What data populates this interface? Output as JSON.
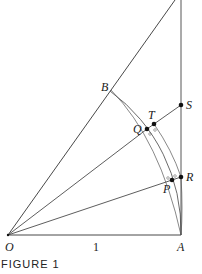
{
  "diagram": {
    "caption": "FIGURE 1",
    "unit_label": "1",
    "points": {
      "O": {
        "label": "O",
        "x": 8,
        "y": 235
      },
      "A": {
        "label": "A",
        "x": 181,
        "y": 235
      },
      "B": {
        "label": "B",
        "x": 110,
        "y": 91
      },
      "Q": {
        "label": "Q",
        "x": 147,
        "y": 129
      },
      "T": {
        "label": "T",
        "x": 154,
        "y": 124
      },
      "S": {
        "label": "S",
        "x": 181,
        "y": 105
      },
      "P": {
        "label": "P",
        "x": 172,
        "y": 180
      },
      "R": {
        "label": "R",
        "x": 181,
        "y": 177
      }
    },
    "colors": {
      "stroke": "#333333",
      "arc": "#555555",
      "text": "#1a1a1a"
    }
  }
}
